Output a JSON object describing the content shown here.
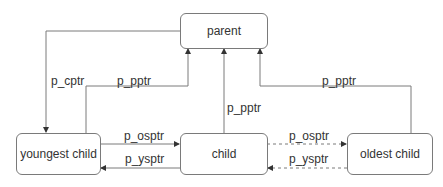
{
  "diagram": {
    "colors": {
      "line": "#7a7a7a",
      "text": "#333333",
      "background": "#ffffff"
    },
    "nodes": {
      "parent": "parent",
      "youngest": "youngest child",
      "child": "child",
      "oldest": "oldest child"
    },
    "edges": [
      {
        "id": "parent-to-youngest",
        "label": "p_cptr",
        "from": "parent",
        "to": "youngest child",
        "style": "solid"
      },
      {
        "id": "youngest-to-parent",
        "label": "p_pptr",
        "from": "youngest child",
        "to": "parent",
        "style": "solid"
      },
      {
        "id": "child-to-parent",
        "label": "p_pptr",
        "from": "child",
        "to": "parent",
        "style": "solid"
      },
      {
        "id": "oldest-to-parent",
        "label": "p_pptr",
        "from": "oldest child",
        "to": "parent",
        "style": "solid"
      },
      {
        "id": "youngest-to-child",
        "label": "p_osptr",
        "from": "youngest child",
        "to": "child",
        "style": "solid"
      },
      {
        "id": "child-to-youngest",
        "label": "p_ysptr",
        "from": "child",
        "to": "youngest child",
        "style": "solid"
      },
      {
        "id": "child-to-oldest",
        "label": "p_osptr",
        "from": "child",
        "to": "oldest child",
        "style": "dashed"
      },
      {
        "id": "oldest-to-child",
        "label": "p_ysptr",
        "from": "oldest child",
        "to": "child",
        "style": "dashed"
      }
    ]
  }
}
